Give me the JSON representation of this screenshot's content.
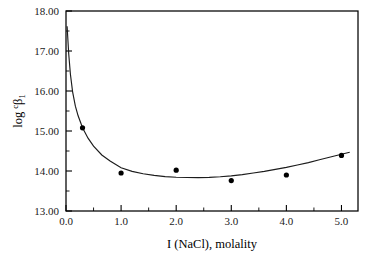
{
  "chart_data": {
    "type": "scatter",
    "title": "",
    "subtitle": "",
    "xlabel": "I (NaCl), molality",
    "ylabel": "log ᶜβ₁",
    "ylabel_parts": {
      "main": "log",
      "superscript": "c",
      "greek": "β",
      "subscript": "1"
    },
    "xlim": [
      0.0,
      5.3
    ],
    "ylim": [
      13.0,
      18.0
    ],
    "x_major_ticks": [
      0.0,
      1.0,
      2.0,
      3.0,
      4.0,
      5.0
    ],
    "x_major_tick_labels": [
      "0.0",
      "1.0",
      "2.0",
      "3.0",
      "4.0",
      "5.0"
    ],
    "x_minor_ticks": [
      0.5,
      1.5,
      2.5,
      3.5,
      4.5
    ],
    "y_major_ticks": [
      13.0,
      14.0,
      15.0,
      16.0,
      17.0,
      18.0
    ],
    "y_major_tick_labels": [
      "13.00",
      "14.00",
      "15.00",
      "16.00",
      "17.00",
      "18.00"
    ],
    "y_minor_ticks": [
      13.5,
      14.5,
      15.5,
      16.5,
      17.5
    ],
    "grid": false,
    "legend": false,
    "legend_position": "none",
    "series": [
      {
        "name": "measured points",
        "marker": "filled-circle",
        "marker_color": "#000000",
        "x": [
          0.3,
          1.0,
          2.0,
          3.0,
          4.0,
          5.0
        ],
        "y": [
          15.08,
          13.95,
          14.02,
          13.76,
          13.9,
          14.39
        ]
      },
      {
        "name": "fitted curve",
        "marker": "none",
        "line_color": "#1c1c1c",
        "x": [
          0.02,
          0.05,
          0.08,
          0.12,
          0.17,
          0.22,
          0.3,
          0.4,
          0.5,
          0.65,
          0.8,
          1.0,
          1.2,
          1.4,
          1.6,
          1.8,
          2.0,
          2.2,
          2.4,
          2.6,
          2.8,
          3.0,
          3.2,
          3.4,
          3.6,
          3.8,
          4.0,
          4.2,
          4.4,
          4.6,
          4.8,
          5.0,
          5.15
        ],
        "y": [
          17.62,
          16.92,
          16.42,
          15.98,
          15.62,
          15.38,
          15.08,
          14.82,
          14.62,
          14.4,
          14.25,
          14.08,
          13.99,
          13.93,
          13.89,
          13.86,
          13.845,
          13.838,
          13.836,
          13.842,
          13.856,
          13.878,
          13.91,
          13.95,
          13.99,
          14.04,
          14.09,
          14.15,
          14.21,
          14.28,
          14.35,
          14.42,
          14.47
        ]
      }
    ]
  },
  "axes": {
    "x_axis_title": "I (NaCl), molality",
    "y_axis_title": "log ᶜβ₁"
  }
}
